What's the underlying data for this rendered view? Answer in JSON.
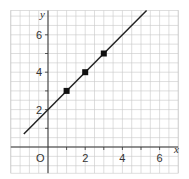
{
  "chart_data": {
    "type": "line",
    "title": "",
    "xlabel": "x",
    "ylabel": "y",
    "origin_label": "O",
    "xlim": [
      -2,
      7
    ],
    "ylim": [
      -1.4,
      7.3
    ],
    "x_ticks": [
      1,
      2,
      3,
      4,
      5,
      6
    ],
    "x_tick_labels": [
      "",
      "2",
      "",
      "4",
      "",
      "6"
    ],
    "y_ticks": [
      1,
      2,
      3,
      4,
      5,
      6
    ],
    "y_tick_labels": [
      "",
      "2",
      "",
      "4",
      "",
      "6"
    ],
    "grid": true,
    "minor_grid_step": 0.5,
    "line": {
      "equation": "y = x + 2",
      "slope": 1,
      "intercept": 2,
      "x_start": -1.3,
      "x_end": 5.3
    },
    "series": [
      {
        "name": "plotted points",
        "x": [
          1,
          2,
          3
        ],
        "y": [
          3,
          4,
          5
        ]
      }
    ],
    "colors": {
      "grid": "#c8c8c8",
      "axis": "#333333",
      "line": "#222222",
      "point": "#111111"
    }
  }
}
